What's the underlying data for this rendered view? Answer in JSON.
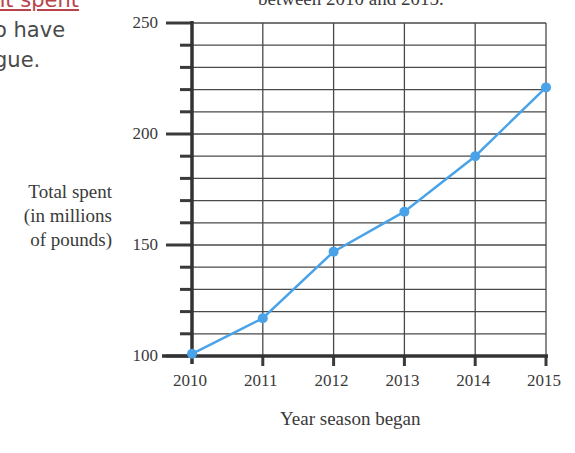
{
  "text_fragment": {
    "line0": "nt spent",
    "line1": "o have",
    "line2": "gue."
  },
  "chart_data": {
    "type": "line",
    "title": "between 2010 and 2015.",
    "xlabel": "Year season began",
    "ylabel": "Total spent (in millions of pounds)",
    "ylabel_lines": [
      "Total spent",
      "(in millions",
      "of pounds)"
    ],
    "categories": [
      "2010",
      "2011",
      "2012",
      "2013",
      "2014",
      "2015"
    ],
    "values": [
      101,
      117,
      147,
      165,
      190,
      221
    ],
    "ylim": [
      100,
      250
    ],
    "y_ticks": [
      100,
      150,
      200,
      250
    ],
    "y_minor_step": 10,
    "grid": true,
    "line_color": "#4aa3e8"
  }
}
